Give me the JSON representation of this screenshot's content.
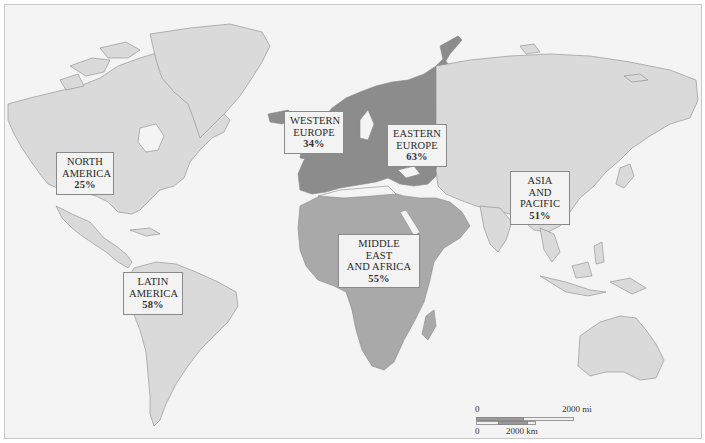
{
  "map": {
    "type": "choropleth-world-map",
    "colors": {
      "ocean": "#f4f4f4",
      "light_region": "#d9d9d9",
      "medium_region": "#a9a9a9",
      "dark_region": "#8c8c8c",
      "border": "#777777"
    },
    "regions": [
      {
        "id": "north-america",
        "line1": "NORTH",
        "line2": "AMERICA",
        "value": "25%",
        "shade": "light"
      },
      {
        "id": "western-europe",
        "line1": "WESTERN",
        "line2": "EUROPE",
        "value": "34%",
        "shade": "dark"
      },
      {
        "id": "eastern-europe",
        "line1": "EASTERN",
        "line2": "EUROPE",
        "value": "63%",
        "shade": "dark"
      },
      {
        "id": "asia-pacific",
        "line1": "ASIA AND",
        "line2": "PACIFIC",
        "value": "51%",
        "shade": "light"
      },
      {
        "id": "middle-east-africa",
        "line1": "MIDDLE EAST",
        "line2": "AND AFRICA",
        "value": "55%",
        "shade": "medium"
      },
      {
        "id": "latin-america",
        "line1": "LATIN",
        "line2": "AMERICA",
        "value": "58%",
        "shade": "light"
      }
    ],
    "scale_bar": {
      "mi_start": "0",
      "mi_end": "2000 mi",
      "km_start": "0",
      "km_end": "2000 km"
    }
  }
}
